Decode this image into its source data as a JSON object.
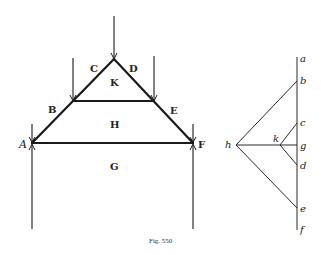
{
  "figure": {
    "caption": "Fig. 550",
    "truss_labels": {
      "A": "A",
      "B": "B",
      "C": "C",
      "D": "D",
      "E": "E",
      "F": "F",
      "G": "G",
      "H": "H",
      "K": "K"
    },
    "force_polygon_labels": {
      "a": "a",
      "b": "b",
      "c": "c",
      "d": "d",
      "e": "e",
      "f": "f",
      "g": "g",
      "h": "h",
      "k": "k"
    }
  }
}
